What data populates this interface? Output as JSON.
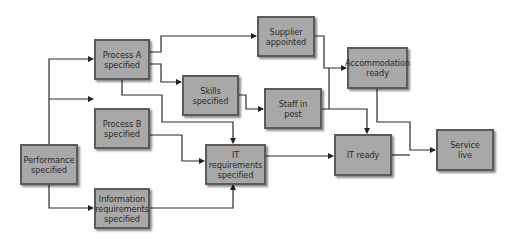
{
  "diagram": {
    "type": "flowchart / dependency network",
    "nodes": [
      {
        "id": "process_a",
        "label": "Process A\nspecified"
      },
      {
        "id": "supplier",
        "label": "Supplier\nappointed"
      },
      {
        "id": "accommodation",
        "label": "Accommodation\nready"
      },
      {
        "id": "skills",
        "label": "Skills\nspecified"
      },
      {
        "id": "staff",
        "label": "Staff in\npost"
      },
      {
        "id": "process_b",
        "label": "Process B\nspecified"
      },
      {
        "id": "performance",
        "label": "Performance\nspecified"
      },
      {
        "id": "it_requirements",
        "label": "IT requirements\nspecified"
      },
      {
        "id": "it_ready",
        "label": "IT ready"
      },
      {
        "id": "service_live",
        "label": "Service\nlive"
      },
      {
        "id": "info_requirements",
        "label": "Information\nrequirements\nspecified"
      }
    ],
    "edges": [
      {
        "from": "Performance specified",
        "to": "Process A specified"
      },
      {
        "from": "Performance specified",
        "to": "Process B specified"
      },
      {
        "from": "Performance specified",
        "to": "Information requirements specified"
      },
      {
        "from": "Process A specified",
        "to": "Supplier appointed"
      },
      {
        "from": "Process A specified",
        "to": "Skills specified"
      },
      {
        "from": "Process A specified",
        "to": "IT requirements specified"
      },
      {
        "from": "Process B specified",
        "to": "IT requirements specified"
      },
      {
        "from": "Information requirements specified",
        "to": "IT requirements specified"
      },
      {
        "from": "Skills specified",
        "to": "Staff in post"
      },
      {
        "from": "Supplier appointed",
        "to": "Accommodation ready"
      },
      {
        "from": "Staff in post",
        "to": "Accommodation ready"
      },
      {
        "from": "Staff in post",
        "to": "IT ready"
      },
      {
        "from": "IT requirements specified",
        "to": "IT ready"
      },
      {
        "from": "Accommodation ready",
        "to": "Service live"
      },
      {
        "from": "IT ready",
        "to": "Service live"
      }
    ]
  }
}
